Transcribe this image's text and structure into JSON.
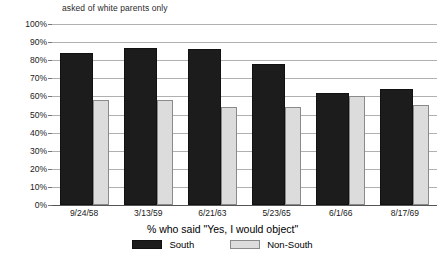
{
  "note": "asked of white parents only",
  "axis_title": "% who said \"Yes, I would object\"",
  "legend": {
    "south_label": "South",
    "nonsouth_label": "Non-South"
  },
  "colors": {
    "south": "#1c1c1c",
    "nonsouth": "#dcdcdc",
    "gridline": "#b0b0b0",
    "background": "#ffffff"
  },
  "chart_data": {
    "type": "bar",
    "title": "asked of white parents only",
    "xlabel": "% who said \"Yes, I would object\"",
    "ylabel": "",
    "ylim": [
      0,
      100
    ],
    "yticks": [
      0,
      10,
      20,
      30,
      40,
      50,
      60,
      70,
      80,
      90,
      100
    ],
    "ytick_labels": [
      "0%",
      "10%",
      "20%",
      "30%",
      "40%",
      "50%",
      "60%",
      "70%",
      "80%",
      "90%",
      "100%"
    ],
    "grid": true,
    "legend_position": "bottom",
    "categories": [
      "9/24/58",
      "3/13/59",
      "6/21/63",
      "5/23/65",
      "6/1/66",
      "8/17/69"
    ],
    "series": [
      {
        "name": "South",
        "values": [
          84,
          87,
          86,
          78,
          62,
          64
        ]
      },
      {
        "name": "Non-South",
        "values": [
          58,
          58,
          54,
          54,
          60,
          55
        ]
      }
    ]
  }
}
